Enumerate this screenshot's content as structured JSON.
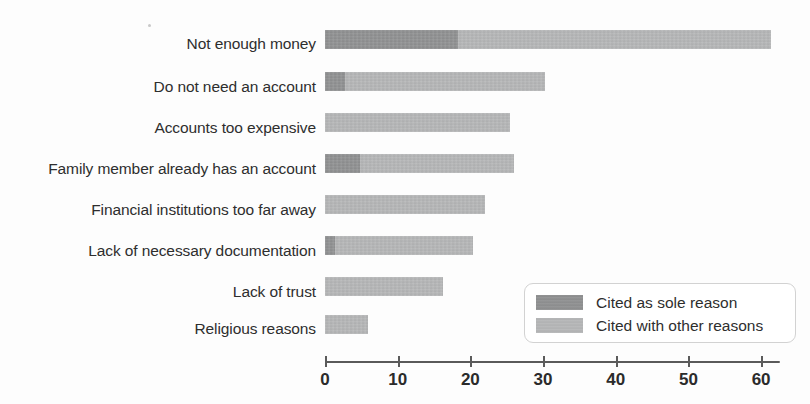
{
  "chart_data": {
    "type": "bar",
    "orientation": "horizontal",
    "stacked": true,
    "title": "",
    "subtitle": "",
    "xlabel": "",
    "ylabel": "",
    "xlim": [
      0,
      62
    ],
    "grid": false,
    "legend_position": "inside-bottom-right",
    "xticks": [
      0,
      10,
      20,
      30,
      40,
      50,
      60
    ],
    "xtick_labels": [
      "0",
      "10",
      "20",
      "30",
      "40",
      "50",
      "60"
    ],
    "categories": [
      "Not enough money",
      "Do not need an account",
      "Accounts too expensive",
      "Family member already has an account",
      "Financial institutions too far away",
      "Lack of necessary documentation",
      "Lack of trust",
      "Religious reasons"
    ],
    "series": [
      {
        "name": "Cited as sole reason",
        "color": "#8f9091",
        "values": [
          18.3,
          2.8,
          0.0,
          4.8,
          0.0,
          1.4,
          0.0,
          0.0
        ]
      },
      {
        "name": "Cited with other reasons",
        "color": "#b5b6b7",
        "values": [
          43.1,
          27.5,
          25.5,
          21.2,
          22.0,
          18.9,
          16.3,
          5.9
        ]
      }
    ],
    "totals": [
      61.4,
      30.3,
      25.5,
      26.0,
      22.0,
      20.3,
      16.3,
      5.9
    ]
  },
  "legend": {
    "items": [
      {
        "label": "Cited as sole reason",
        "color": "#8f9091"
      },
      {
        "label": "Cited with other reasons",
        "color": "#b5b6b7"
      }
    ]
  },
  "axis": {
    "tick_labels": [
      "0",
      "10",
      "20",
      "30",
      "40",
      "50",
      "60"
    ]
  },
  "colors": {
    "sole_reason": "#8f9091",
    "other_reasons": "#b5b6b7",
    "axis": "#5a5a5a",
    "text": "#2e2e2e",
    "background": "#fdfdfd",
    "legend_border": "#d2d2d2"
  }
}
